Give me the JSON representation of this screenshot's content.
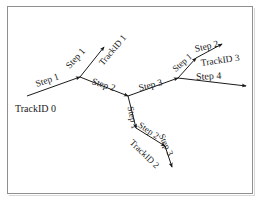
{
  "figure": {
    "background_color": "#ffffff",
    "line_color": "#1a1a1a",
    "border_color": "#8f8f8f"
  },
  "labels": {
    "trackid0": "TrackID 0",
    "trackid1": "TrackID 1",
    "trackid2": "TrackID 2",
    "trackid3": "TrackID 3",
    "step1_a": "Step 1",
    "step1_b": "Step 1",
    "step2_a": "Step 2",
    "step3_a": "Step 3",
    "step1_c": "Step 1",
    "step2_b": "Step 2",
    "step4": "Step 4",
    "step1_d": "Step 1",
    "step2_c": "Step 2",
    "step3_b": "Step 3"
  },
  "diagram_data": {
    "type": "node-link-graph",
    "tracks": [
      {
        "id": "TrackID 0",
        "steps": [
          "Step 1",
          "Step 2",
          "Step 3",
          "Step 4"
        ]
      },
      {
        "id": "TrackID 1",
        "steps": [
          "Step 1"
        ]
      },
      {
        "id": "TrackID 2",
        "steps": [
          "Step 1",
          "Step 2"
        ]
      },
      {
        "id": "TrackID 3",
        "steps": [
          "Step 1",
          "Step 2"
        ]
      }
    ],
    "nodes": [
      {
        "name": "origin",
        "x": 27,
        "y": 96
      },
      {
        "name": "branch-a",
        "x": 80,
        "y": 77
      },
      {
        "name": "branch-b",
        "x": 128,
        "y": 96
      },
      {
        "name": "branch-c",
        "x": 178,
        "y": 78
      },
      {
        "name": "branch-d",
        "x": 196,
        "y": 58
      },
      {
        "name": "branch-e",
        "x": 136,
        "y": 128
      },
      {
        "name": "branch-f",
        "x": 165,
        "y": 146
      }
    ],
    "edges": [
      {
        "from": "origin",
        "to": "branch-a",
        "label": "Step 1"
      },
      {
        "from": "branch-a",
        "to": "leaf-trackid1",
        "label": "Step 1"
      },
      {
        "from": "branch-a",
        "to": "branch-b",
        "label": "Step 2"
      },
      {
        "from": "branch-b",
        "to": "branch-c",
        "label": "Step 3"
      },
      {
        "from": "branch-c",
        "to": "branch-d",
        "label": "Step 1"
      },
      {
        "from": "branch-d",
        "to": "leaf-trackid3",
        "label": "Step 2"
      },
      {
        "from": "branch-c",
        "to": "leaf-step4",
        "label": "Step 4"
      },
      {
        "from": "branch-b",
        "to": "branch-e",
        "label": "Step 1"
      },
      {
        "from": "branch-e",
        "to": "branch-f",
        "label": "Step 2"
      },
      {
        "from": "branch-f",
        "to": "leaf-trackid2",
        "label": "Step 3"
      }
    ]
  }
}
